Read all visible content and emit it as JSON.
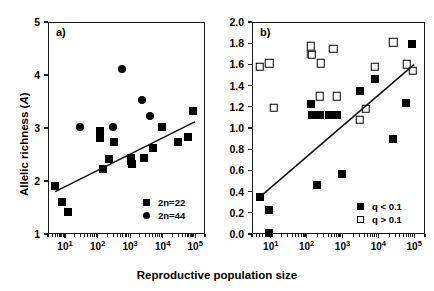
{
  "figure": {
    "xlabel": "Reproductive population size",
    "ylabel_a_text": "Allelic richness (",
    "ylabel_a_italic": "A",
    "ylabel_a_close": ")"
  },
  "panel_a": {
    "label": "a)",
    "legend": [
      {
        "marker": "filled-square",
        "text": "2n=22"
      },
      {
        "marker": "filled-circle",
        "text": "2n=44"
      }
    ],
    "yticks": [
      "1",
      "2",
      "3",
      "4",
      "5"
    ],
    "xticks": [
      "10",
      "10",
      "10",
      "10",
      "10"
    ],
    "xexps": [
      "1",
      "2",
      "3",
      "4",
      "5"
    ]
  },
  "panel_b": {
    "label": "b)",
    "legend": [
      {
        "marker": "filled-square",
        "text": "q < 0.1"
      },
      {
        "marker": "open-square",
        "text": "q > 0.1"
      }
    ],
    "yticks": [
      "0.0",
      "0.2",
      "0.4",
      "0.6",
      "0.8",
      "1.0",
      "1.2",
      "1.4",
      "1.6",
      "1.8",
      "2.0"
    ],
    "xticks": [
      "10",
      "10",
      "10",
      "10",
      "10"
    ],
    "xexps": [
      "1",
      "2",
      "3",
      "4",
      "5"
    ]
  },
  "chart_data": [
    {
      "type": "scatter",
      "panel": "a)",
      "title": "",
      "xlabel": "Reproductive population size",
      "ylabel": "Allelic richness (A)",
      "xscale": "log",
      "xlim": [
        3,
        200000
      ],
      "ylim": [
        1,
        5
      ],
      "yticks": [
        1,
        2,
        3,
        4,
        5
      ],
      "xticks": [
        10,
        100,
        1000,
        10000,
        100000
      ],
      "grid": false,
      "legend_position": "bottom-right",
      "series": [
        {
          "name": "2n=22",
          "marker": "filled-square",
          "points": [
            [
              5,
              1.91
            ],
            [
              8,
              1.61
            ],
            [
              12,
              1.42
            ],
            [
              120,
              2.94
            ],
            [
              122,
              2.82
            ],
            [
              150,
              2.23
            ],
            [
              230,
              2.42
            ],
            [
              330,
              2.73
            ],
            [
              1050,
              2.43
            ],
            [
              1100,
              2.37
            ],
            [
              1150,
              2.33
            ],
            [
              2700,
              2.43
            ],
            [
              5000,
              2.62
            ],
            [
              9500,
              3.01
            ],
            [
              30000,
              2.73
            ],
            [
              62000,
              2.83
            ],
            [
              85000,
              3.32
            ]
          ]
        },
        {
          "name": "2n=44",
          "marker": "filled-circle",
          "points": [
            [
              28,
              3.01
            ],
            [
              300,
              3.02
            ],
            [
              560,
              4.12
            ],
            [
              2400,
              3.53
            ],
            [
              4200,
              3.22
            ]
          ]
        }
      ],
      "regression_line": {
        "x": [
          5,
          100000
        ],
        "y": [
          1.8,
          3.12
        ]
      }
    },
    {
      "type": "scatter",
      "panel": "b)",
      "title": "",
      "xlabel": "Reproductive population size",
      "ylabel": "",
      "xscale": "log",
      "xlim": [
        3,
        200000
      ],
      "ylim": [
        0.0,
        2.0
      ],
      "yticks": [
        0.0,
        0.2,
        0.4,
        0.6,
        0.8,
        1.0,
        1.2,
        1.4,
        1.6,
        1.8,
        2.0
      ],
      "xticks": [
        10,
        100,
        1000,
        10000,
        100000
      ],
      "grid": false,
      "legend_position": "bottom-right",
      "series": [
        {
          "name": "q < 0.1",
          "marker": "filled-square",
          "points": [
            [
              5,
              0.35
            ],
            [
              9,
              0.23
            ],
            [
              9,
              0.01
            ],
            [
              135,
              1.23
            ],
            [
              140,
              1.12
            ],
            [
              230,
              1.12
            ],
            [
              420,
              1.12
            ],
            [
              700,
              1.12
            ],
            [
              1000,
              0.57
            ],
            [
              190,
              0.46
            ],
            [
              3000,
              1.35
            ],
            [
              8000,
              1.46
            ],
            [
              26000,
              0.9
            ],
            [
              60000,
              1.24
            ],
            [
              85000,
              1.79
            ]
          ]
        },
        {
          "name": "q > 0.1",
          "marker": "open-square",
          "points": [
            [
              5,
              1.58
            ],
            [
              9,
              1.61
            ],
            [
              12,
              1.19
            ],
            [
              130,
              1.77
            ],
            [
              135,
              1.7
            ],
            [
              140,
              1.69
            ],
            [
              250,
              1.61
            ],
            [
              230,
              1.3
            ],
            [
              560,
              1.75
            ],
            [
              700,
              1.3
            ],
            [
              3000,
              1.08
            ],
            [
              4500,
              1.18
            ],
            [
              8000,
              1.58
            ],
            [
              26000,
              1.81
            ],
            [
              62000,
              1.6
            ],
            [
              90000,
              1.54
            ]
          ]
        }
      ],
      "regression_line": {
        "x": [
          5,
          100000
        ],
        "y": [
          0.35,
          1.6
        ]
      }
    }
  ]
}
